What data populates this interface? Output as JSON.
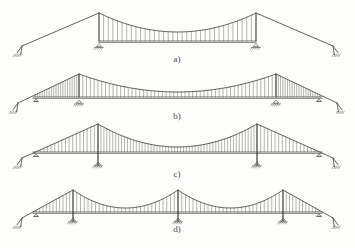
{
  "figure": {
    "background_color": "#fdfdfb",
    "line_color": "#3a3a3a",
    "hanger_color": "#5a5a5a",
    "panels": [
      {
        "id": "a",
        "label": "a)",
        "description": "Two-tower suspension bridge, deck only between towers, free side-span cables to anchorages",
        "towers": 2,
        "main_spans": 1,
        "deck_extent": "between-towers-only",
        "side_span_hangers": false,
        "tower_base": "roller-on-deck-level",
        "anchorages": 2
      },
      {
        "id": "b",
        "label": "b)",
        "description": "Two-tower suspension bridge, continuous deck through side spans with hangers, deck ends on supports near anchorages",
        "towers": 2,
        "main_spans": 1,
        "deck_extent": "full-width-continuous",
        "side_span_hangers": true,
        "tower_base": "roller-on-deck-level",
        "anchorages": 2
      },
      {
        "id": "c",
        "label": "c)",
        "description": "Two-tower suspension bridge, continuous deck, slender towers carried down to ground supports",
        "towers": 2,
        "main_spans": 1,
        "deck_extent": "full-width-continuous",
        "side_span_hangers": true,
        "tower_base": "column-to-ground",
        "anchorages": 2
      },
      {
        "id": "d",
        "label": "d)",
        "description": "Three-tower suspension bridge with two main spans, continuous deck, towers carried down to ground supports",
        "towers": 3,
        "main_spans": 2,
        "deck_extent": "full-width-continuous",
        "side_span_hangers": true,
        "tower_base": "column-to-ground",
        "anchorages": 2
      }
    ]
  },
  "chart_data": {
    "type": "diagram",
    "xlabel": "",
    "ylabel": "",
    "panel_labels": [
      "a)",
      "b)",
      "c)",
      "d)"
    ],
    "geometry": {
      "canvas": [
        355,
        248
      ],
      "panel_a": {
        "label_pos": [
          177,
          62
        ],
        "deck_y": 41,
        "tower_x": [
          99,
          256
        ],
        "tower_top_y": 13,
        "cable_sag_y": 32,
        "mid_x": 177.5,
        "anchor_left": [
          22,
          46
        ],
        "anchor_right": [
          333,
          46
        ],
        "hanger_count_per_half": 17
      },
      "panel_b": {
        "label_pos": [
          177,
          119
        ],
        "deck_y": 97,
        "tower_x": [
          79,
          276
        ],
        "tower_top_y": 74,
        "cable_sag_y": 92,
        "mid_x": 177.5,
        "anchor_left": [
          18,
          103
        ],
        "anchor_right": [
          337,
          103
        ],
        "deck_end_left_x": 33,
        "deck_end_right_x": 322,
        "hanger_count_per_half": 26
      },
      "panel_c": {
        "label_pos": [
          177,
          177
        ],
        "deck_y": 152,
        "tower_x": [
          98,
          257
        ],
        "tower_top_y": 124,
        "tower_base_y": 165,
        "cable_sag_y": 147,
        "mid_x": 177.5,
        "anchor_left": [
          22,
          158
        ],
        "anchor_right": [
          333,
          158
        ],
        "deck_end_left_x": 33,
        "deck_end_right_x": 322,
        "hanger_count_per_half": 27
      },
      "panel_d": {
        "label_pos": [
          177,
          232
        ],
        "deck_y": 212,
        "tower_x": [
          73,
          178,
          283
        ],
        "tower_top_y": 190,
        "tower_base_y": 221,
        "cable_sag_y": 208,
        "anchor_left": [
          22,
          218
        ],
        "anchor_right": [
          333,
          218
        ],
        "deck_end_left_x": 33,
        "deck_end_right_x": 322,
        "hanger_count_per_half": 14
      }
    }
  }
}
